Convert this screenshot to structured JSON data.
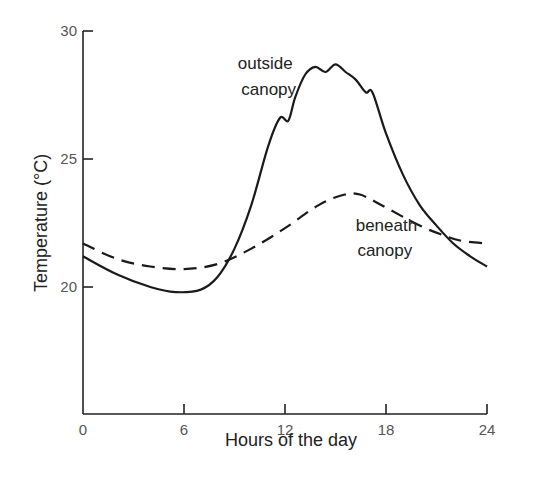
{
  "chart_data": {
    "type": "line",
    "title": "",
    "xlabel": "Hours of the day",
    "ylabel": "Temperature (°C)",
    "xlim": [
      0,
      24
    ],
    "ylim": [
      15,
      30
    ],
    "xticks": [
      "0",
      "6",
      "12",
      "18",
      "24"
    ],
    "yticks": [
      "20",
      "25",
      "30"
    ],
    "grid": false,
    "legend": "none (inline annotations)",
    "series": [
      {
        "name": "outside canopy",
        "style": "solid",
        "x": [
          0,
          2,
          4,
          5.5,
          7,
          8,
          9,
          10,
          11,
          11.7,
          12.2,
          12.6,
          13.2,
          13.8,
          14.4,
          15,
          15.6,
          16.2,
          16.8,
          17.2,
          18,
          19,
          20,
          21,
          22,
          23,
          24
        ],
        "y": [
          21.2,
          20.5,
          20.0,
          19.8,
          19.9,
          20.4,
          21.5,
          23.2,
          25.5,
          26.6,
          26.5,
          27.4,
          28.3,
          28.6,
          28.4,
          28.7,
          28.4,
          28.1,
          27.6,
          27.6,
          26.0,
          24.4,
          23.2,
          22.4,
          21.7,
          21.2,
          20.8
        ]
      },
      {
        "name": "beneath canopy",
        "style": "dashed",
        "x": [
          0,
          2,
          4,
          6,
          8,
          10,
          12,
          14,
          15.5,
          16.5,
          18,
          20,
          21.5,
          22.5,
          24
        ],
        "y": [
          21.7,
          21.1,
          20.8,
          20.7,
          20.9,
          21.5,
          22.3,
          23.2,
          23.6,
          23.6,
          23.1,
          22.4,
          22.0,
          21.8,
          21.7
        ]
      }
    ],
    "annotations": [
      {
        "text": "outside",
        "x": 9.2,
        "y": 28.5
      },
      {
        "text": "canopy",
        "x": 9.4,
        "y": 27.5
      },
      {
        "text": "beneath",
        "x": 16.2,
        "y": 22.2
      },
      {
        "text": "canopy",
        "x": 16.3,
        "y": 21.2
      }
    ]
  }
}
